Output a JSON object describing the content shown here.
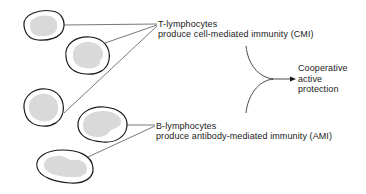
{
  "t_group": {
    "title": "T-lymphocytes",
    "description": "produce cell-mediated immunity (CMI)",
    "cell_count": 3
  },
  "b_group": {
    "title": "B-lymphocytes",
    "description": "produce antibody-mediated immunity (AMI)",
    "cell_count": 2
  },
  "outcome": {
    "lines": [
      "Cooperative",
      "active",
      "protection"
    ]
  },
  "colors": {
    "cell_outline": "#1a1a1a",
    "nucleus_fill": "#d9d9d9",
    "connector_line": "#555555",
    "text": "#1a1a1a"
  }
}
